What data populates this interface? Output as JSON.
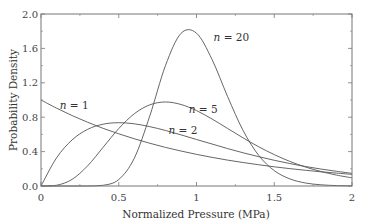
{
  "chart_data": {
    "type": "line",
    "title": "",
    "xlabel": "Normalized Pressure (MPa)",
    "ylabel": "Probability Density",
    "xlim": [
      0,
      2
    ],
    "ylim": [
      0,
      2.0
    ],
    "grid": false,
    "legend": "none (inline curve annotations)",
    "x_ticks": [
      "0",
      "0.5",
      "1",
      "1.5",
      "2"
    ],
    "y_ticks": [
      "0.0",
      "0.4",
      "0.8",
      "1.2",
      "1.6",
      "2.0"
    ],
    "x": [
      0,
      0.1,
      0.2,
      0.3,
      0.4,
      0.5,
      0.6,
      0.7,
      0.8,
      0.9,
      1.0,
      1.1,
      1.2,
      1.3,
      1.4,
      1.5,
      1.6,
      1.7,
      1.8,
      1.9,
      2.0
    ],
    "series": [
      {
        "name": "n = 1",
        "values": [
          1.0,
          0.905,
          0.819,
          0.741,
          0.67,
          0.607,
          0.549,
          0.497,
          0.449,
          0.407,
          0.368,
          0.333,
          0.301,
          0.273,
          0.247,
          0.223,
          0.202,
          0.183,
          0.165,
          0.15,
          0.135
        ]
      },
      {
        "name": "n = 2",
        "values": [
          0.0,
          0.327,
          0.536,
          0.659,
          0.719,
          0.736,
          0.723,
          0.69,
          0.646,
          0.595,
          0.541,
          0.488,
          0.435,
          0.386,
          0.341,
          0.299,
          0.261,
          0.227,
          0.197,
          0.171,
          0.147
        ]
      },
      {
        "name": "n = 5",
        "values": [
          0.0,
          0.008,
          0.077,
          0.235,
          0.451,
          0.668,
          0.84,
          0.944,
          0.977,
          0.948,
          0.877,
          0.779,
          0.669,
          0.559,
          0.456,
          0.365,
          0.286,
          0.221,
          0.169,
          0.127,
          0.095
        ]
      },
      {
        "name": "n = 20",
        "values": [
          0.0,
          0.0,
          0.0,
          0.0003,
          0.008,
          0.075,
          0.323,
          0.817,
          1.398,
          1.774,
          1.777,
          1.471,
          1.04,
          0.644,
          0.356,
          0.179,
          0.083,
          0.035,
          0.014,
          0.005,
          0.002
        ]
      }
    ],
    "annotations": [
      {
        "label": "n = 1",
        "x": 0.12,
        "y": 0.89
      },
      {
        "label": "n = 2",
        "x": 0.82,
        "y": 0.61
      },
      {
        "label": "n = 5",
        "x": 0.95,
        "y": 0.85
      },
      {
        "label": "n = 20",
        "x": 1.11,
        "y": 1.69
      }
    ]
  },
  "colors": {
    "line": "#555555",
    "axis": "#666666",
    "background": "#ffffff"
  }
}
